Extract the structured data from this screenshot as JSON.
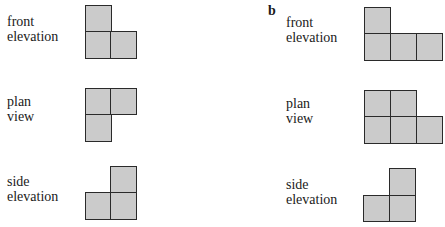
{
  "panels": [
    {
      "letter": "",
      "views": [
        {
          "name": "front-elevation",
          "line1": "front",
          "line2": "elevation"
        },
        {
          "name": "plan-view",
          "line1": "plan",
          "line2": "view"
        },
        {
          "name": "side-elevation",
          "line1": "side",
          "line2": "elevation"
        }
      ]
    },
    {
      "letter": "b",
      "views": [
        {
          "name": "front-elevation",
          "line1": "front",
          "line2": "elevation"
        },
        {
          "name": "plan-view",
          "line1": "plan",
          "line2": "view"
        },
        {
          "name": "side-elevation",
          "line1": "side",
          "line2": "elevation"
        }
      ]
    }
  ],
  "colors": {
    "cell_fill": "#cbcbcb",
    "cell_border": "#2a2a2a"
  },
  "grids": {
    "a_front": {
      "cells_rowcol": [
        [
          0,
          0
        ],
        [
          1,
          0
        ],
        [
          1,
          1
        ]
      ]
    },
    "a_plan": {
      "cells_rowcol": [
        [
          0,
          0
        ],
        [
          0,
          1
        ],
        [
          1,
          0
        ]
      ]
    },
    "a_side": {
      "cells_rowcol": [
        [
          0,
          1
        ],
        [
          1,
          0
        ],
        [
          1,
          1
        ]
      ]
    },
    "b_front": {
      "cells_rowcol": [
        [
          0,
          0
        ],
        [
          1,
          0
        ],
        [
          1,
          1
        ],
        [
          1,
          2
        ]
      ]
    },
    "b_plan": {
      "cells_rowcol": [
        [
          0,
          0
        ],
        [
          0,
          1
        ],
        [
          1,
          0
        ],
        [
          1,
          1
        ],
        [
          1,
          2
        ]
      ]
    },
    "b_side": {
      "cells_rowcol": [
        [
          0,
          1
        ],
        [
          1,
          0
        ],
        [
          1,
          1
        ]
      ]
    }
  }
}
